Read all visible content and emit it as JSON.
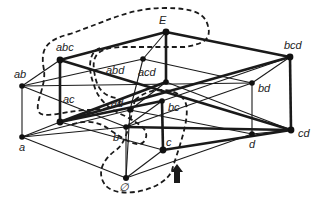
{
  "diagram": {
    "title": "",
    "type": "hasse-diagram",
    "nodes": [
      {
        "id": "E",
        "label": "E",
        "x": 166,
        "y": 32,
        "lx": 159,
        "ly": 24
      },
      {
        "id": "abc",
        "label": "abc",
        "x": 60,
        "y": 60,
        "lx": 56,
        "ly": 51
      },
      {
        "id": "abd",
        "label": "abd",
        "x": 143,
        "y": 59,
        "lx": 106,
        "ly": 74
      },
      {
        "id": "bcd",
        "label": "bcd",
        "x": 290,
        "y": 57,
        "lx": 284,
        "ly": 49
      },
      {
        "id": "ab",
        "label": "ab",
        "x": 22,
        "y": 86,
        "lx": 14,
        "ly": 78
      },
      {
        "id": "acd",
        "label": "acd",
        "x": 166,
        "y": 82,
        "lx": 138,
        "ly": 76
      },
      {
        "id": "bd",
        "label": "bd",
        "x": 252,
        "y": 83,
        "lx": 258,
        "ly": 92
      },
      {
        "id": "cd",
        "label": "cd",
        "x": 291,
        "y": 130,
        "lx": 298,
        "ly": 137
      },
      {
        "id": "ac",
        "label": "ac",
        "x": 60,
        "y": 122,
        "lx": 63,
        "ly": 103
      },
      {
        "id": "ad",
        "label": "ad",
        "x": 130,
        "y": 110,
        "lx": 111,
        "ly": 107
      },
      {
        "id": "bc",
        "label": "bc",
        "x": 162,
        "y": 101,
        "lx": 168,
        "ly": 111
      },
      {
        "id": "a",
        "label": "a",
        "x": 22,
        "y": 137,
        "lx": 19,
        "ly": 151
      },
      {
        "id": "b",
        "label": "b",
        "x": 126,
        "y": 127,
        "lx": 113,
        "ly": 141
      },
      {
        "id": "c",
        "label": "c",
        "x": 163,
        "y": 150,
        "lx": 166,
        "ly": 146
      },
      {
        "id": "d",
        "label": "d",
        "x": 252,
        "y": 134,
        "lx": 249,
        "ly": 148
      },
      {
        "id": "empty",
        "label": "∅",
        "x": 126,
        "y": 178,
        "lx": 119,
        "ly": 191
      }
    ],
    "edges_thick": [
      [
        "abc",
        "E"
      ],
      [
        "E",
        "bcd"
      ],
      [
        "abc",
        "cd"
      ],
      [
        "ac",
        "bcd"
      ],
      [
        "abc",
        "ac"
      ],
      [
        "E",
        "acd"
      ],
      [
        "bcd",
        "cd"
      ],
      [
        "ac",
        "bc"
      ],
      [
        "b",
        "cd"
      ],
      [
        "c",
        "cd"
      ],
      [
        "acd",
        "ac"
      ],
      [
        "bc",
        "c"
      ]
    ],
    "edges_thin": [
      [
        "ab",
        "abc"
      ],
      [
        "ab",
        "abd"
      ],
      [
        "ab",
        "bd"
      ],
      [
        "ab",
        "a"
      ],
      [
        "a",
        "ac"
      ],
      [
        "a",
        "ad"
      ],
      [
        "a",
        "empty"
      ],
      [
        "a",
        "b"
      ],
      [
        "abd",
        "E"
      ],
      [
        "abd",
        "bd"
      ],
      [
        "abd",
        "ad"
      ],
      [
        "bd",
        "bcd"
      ],
      [
        "bd",
        "d"
      ],
      [
        "ad",
        "d"
      ],
      [
        "ad",
        "empty"
      ],
      [
        "d",
        "cd"
      ],
      [
        "d",
        "empty"
      ],
      [
        "b",
        "empty"
      ],
      [
        "b",
        "bd"
      ],
      [
        "c",
        "empty"
      ],
      [
        "acd",
        "cd"
      ],
      [
        "ad",
        "acd"
      ],
      [
        "b",
        "bc"
      ],
      [
        "ac",
        "c"
      ],
      [
        "bc",
        "bcd"
      ],
      [
        "b",
        "ab"
      ]
    ],
    "arrow": {
      "symbol": "up-arrow",
      "x": 177,
      "y": 167,
      "color": "#1a1a1a"
    },
    "dashed_regions": 3
  }
}
